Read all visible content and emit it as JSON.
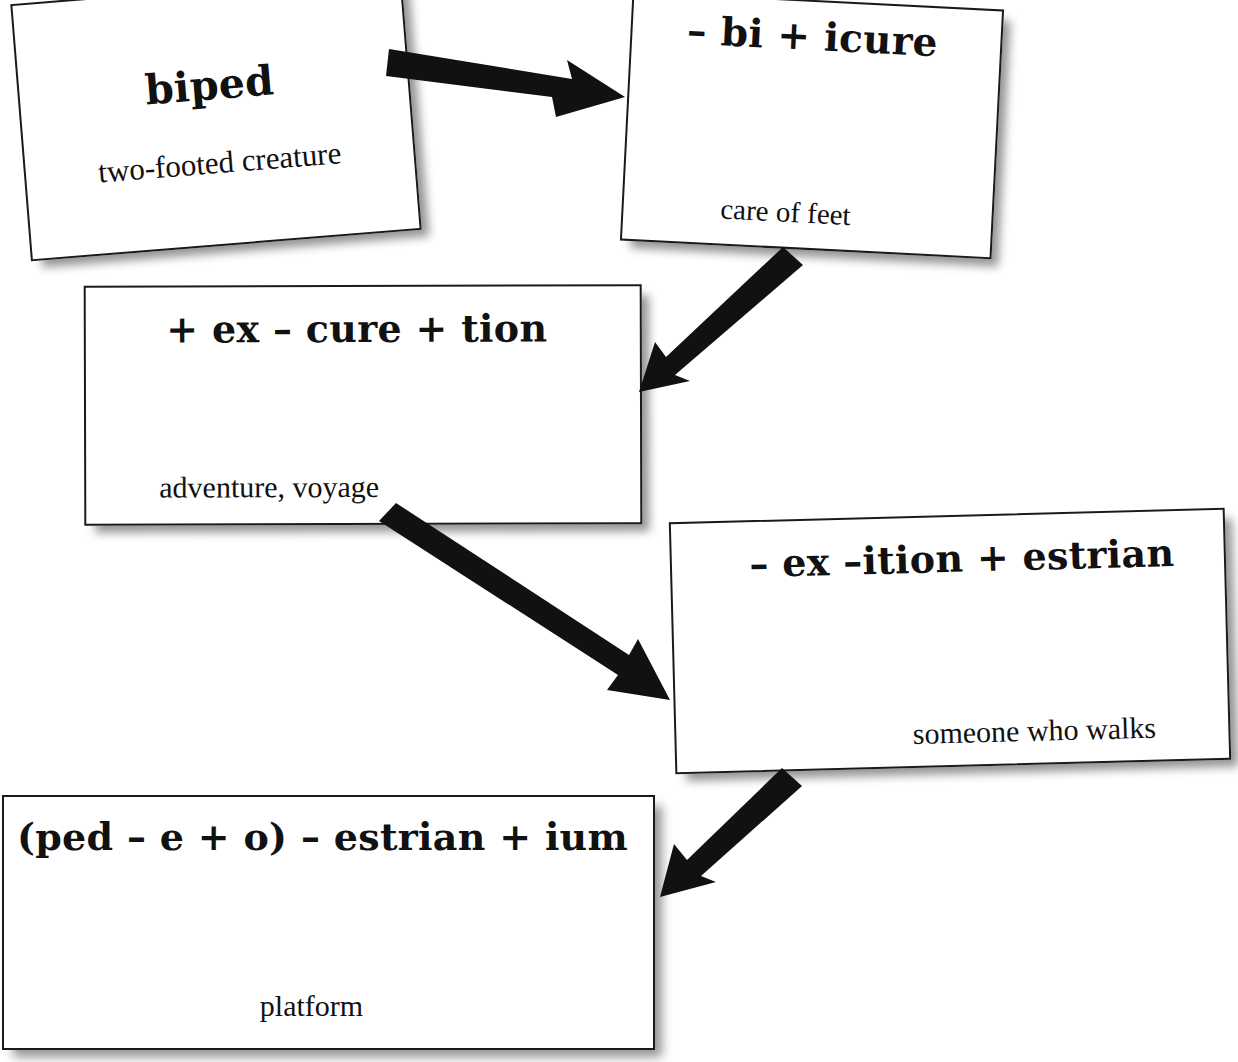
{
  "diagram": {
    "background_color": "#ffffff",
    "ink_color": "#111111",
    "cards": [
      {
        "id": "card-1",
        "name": "biped",
        "title": "biped",
        "definition": "two-footed creature"
      },
      {
        "id": "card-2",
        "name": "pedicure",
        "title": "– bi + icure",
        "definition": "care of feet"
      },
      {
        "id": "card-3",
        "name": "expedition",
        "title": "+ ex – cure + tion",
        "definition": "adventure, voyage"
      },
      {
        "id": "card-4",
        "name": "pedestrian",
        "title": "– ex –ition + estrian",
        "definition": "someone who walks"
      },
      {
        "id": "card-5",
        "name": "podium",
        "title": "(ped – e + o) – estrian + ium",
        "definition": "platform"
      }
    ],
    "arrows": [
      {
        "id": "arrow-1",
        "from": "card-1",
        "to": "card-2",
        "direction": "right-down"
      },
      {
        "id": "arrow-2",
        "from": "card-2",
        "to": "card-3",
        "direction": "down-left"
      },
      {
        "id": "arrow-3",
        "from": "card-3",
        "to": "card-4",
        "direction": "down-right"
      },
      {
        "id": "arrow-4",
        "from": "card-4",
        "to": "card-5",
        "direction": "down-left"
      }
    ]
  }
}
